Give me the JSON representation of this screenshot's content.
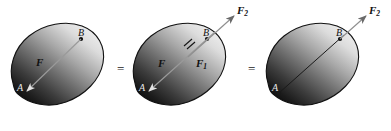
{
  "diagram": {
    "background_color": "#ffffff",
    "body_outline_color": "#111111",
    "body_light_color": "#e6e6e6",
    "body_dark_color": "#0d0d0d",
    "force_arrow_light_color": "#d8d8d8",
    "force_arrow_dark_color": "#111111",
    "operators": [
      {
        "name": "equals-1",
        "symbol": "=",
        "x": 117,
        "y": 62
      },
      {
        "name": "equals-2",
        "symbol": "=",
        "x": 248,
        "y": 62
      }
    ],
    "figures": [
      {
        "id": "figure-1",
        "caption": "rigid body with force F applied at point A",
        "points": [
          {
            "label": "A",
            "x": 17,
            "y": 88
          },
          {
            "label": "B",
            "x": 78,
            "y": 33
          }
        ],
        "vectors": [
          {
            "label": "F",
            "subscript": "",
            "label_x": 36,
            "label_y": 59
          }
        ]
      },
      {
        "id": "figure-2",
        "caption": "equivalent force pair F1 and F2 along the line of action",
        "points": [
          {
            "label": "A",
            "x": 139,
            "y": 88
          },
          {
            "label": "B",
            "x": 202,
            "y": 33
          }
        ],
        "vectors": [
          {
            "label": "F",
            "subscript": "",
            "label_x": 158,
            "label_y": 60
          },
          {
            "label": "F",
            "subscript": "1",
            "label_x": 196,
            "label_y": 60
          },
          {
            "label": "F",
            "subscript": "2",
            "label_x": 218,
            "label_y": 6
          }
        ]
      },
      {
        "id": "figure-3",
        "caption": "force F2 transmitted to point B along the same line",
        "points": [
          {
            "label": "A",
            "x": 272,
            "y": 88
          },
          {
            "label": "B",
            "x": 333,
            "y": 33
          }
        ],
        "vectors": [
          {
            "label": "F",
            "subscript": "2",
            "label_x": 350,
            "label_y": 6
          }
        ]
      }
    ]
  }
}
